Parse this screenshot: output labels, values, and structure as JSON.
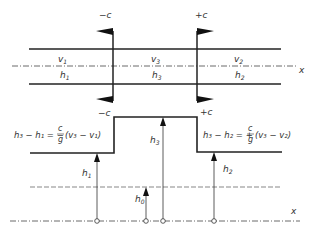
{
  "diagram": {
    "colors": {
      "line": "#222222",
      "text": "#333333",
      "background": "#ffffff"
    },
    "top": {
      "wave_left_label": "−c",
      "wave_right_label": "+c",
      "axis_label": "x",
      "regions": [
        {
          "v": "v",
          "v_sub": "1",
          "h": "h",
          "h_sub": "1"
        },
        {
          "v": "v",
          "v_sub": "3",
          "h": "h",
          "h_sub": "3"
        },
        {
          "v": "v",
          "v_sub": "2",
          "h": "h",
          "h_sub": "2"
        }
      ]
    },
    "bottom": {
      "wave_left_label": "−c",
      "wave_right_label": "+c",
      "axis_label": "x",
      "eq_left": {
        "lhs": "h₃ − h₁ = −",
        "num": "c",
        "den": "g",
        "rhs": "(v₃ − v₁)"
      },
      "eq_right": {
        "lhs": "h₃ − h₂ = +",
        "num": "c",
        "den": "g",
        "rhs": "(v₃ − v₂)"
      },
      "heights": [
        {
          "label": "h",
          "sub": "1"
        },
        {
          "label": "h",
          "sub": "0"
        },
        {
          "label": "h",
          "sub": "3"
        },
        {
          "label": "h",
          "sub": "2"
        }
      ]
    }
  }
}
